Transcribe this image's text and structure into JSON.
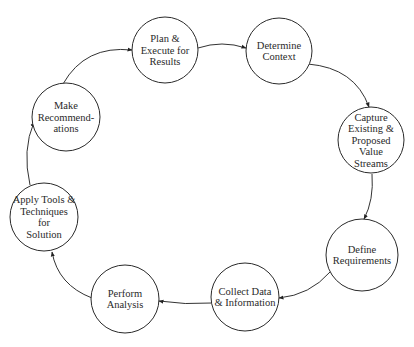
{
  "diagram": {
    "type": "cycle",
    "colors": {
      "stroke": "#2a2a2a",
      "text": "#2a2a2a",
      "background": "#ffffff"
    },
    "nodes": [
      {
        "id": "plan",
        "lines": [
          "Plan &",
          "Execute for",
          "Results"
        ],
        "cx": 165,
        "cy": 50,
        "r": 33
      },
      {
        "id": "determine",
        "lines": [
          "Determine",
          "Context"
        ],
        "cx": 279,
        "cy": 51,
        "r": 33
      },
      {
        "id": "capture",
        "lines": [
          "Capture",
          "Existing &",
          "Proposed",
          "Value",
          "Streams"
        ],
        "cx": 371,
        "cy": 140,
        "r": 33
      },
      {
        "id": "define",
        "lines": [
          "Define",
          "Requirements"
        ],
        "cx": 362,
        "cy": 255,
        "r": 36
      },
      {
        "id": "collect",
        "lines": [
          "Collect Data",
          "& Information"
        ],
        "cx": 245,
        "cy": 297,
        "r": 34
      },
      {
        "id": "perform",
        "lines": [
          "Perform",
          "Analysis"
        ],
        "cx": 125,
        "cy": 299,
        "r": 34
      },
      {
        "id": "apply",
        "lines": [
          "Apply Tools &",
          "Techniques",
          "for",
          "Solution"
        ],
        "cx": 44,
        "cy": 217,
        "r": 34
      },
      {
        "id": "make",
        "lines": [
          "Make",
          "Recommend-",
          "ations"
        ],
        "cx": 66,
        "cy": 117,
        "r": 34
      }
    ],
    "edges": [
      {
        "from": "plan",
        "to": "determine",
        "path": "M198,48 Q222,40 246,48"
      },
      {
        "from": "determine",
        "to": "capture",
        "path": "M308,64 Q355,68 369,107"
      },
      {
        "from": "capture",
        "to": "define",
        "path": "M372,174 Q374,200 364,219"
      },
      {
        "from": "define",
        "to": "collect",
        "path": "M330,272 Q310,295 279,298"
      },
      {
        "from": "collect",
        "to": "perform",
        "path": "M212,303 Q185,305 159,301"
      },
      {
        "from": "perform",
        "to": "apply",
        "path": "M92,298 Q58,285 52,252"
      },
      {
        "from": "apply",
        "to": "make",
        "path": "M30,185 Q22,150 34,122"
      },
      {
        "from": "make",
        "to": "plan",
        "path": "M63,84 Q85,45 132,50"
      }
    ]
  }
}
